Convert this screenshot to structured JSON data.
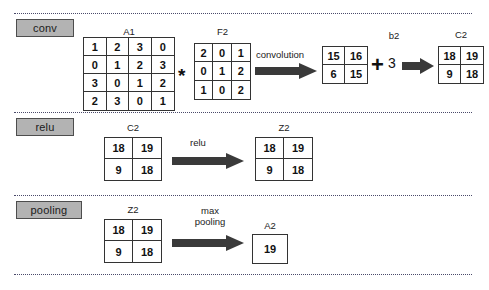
{
  "sections": [
    {
      "id": "conv",
      "tag": "conv",
      "matrices": [
        {
          "name": "A1",
          "rows": [
            [
              1,
              2,
              3,
              0
            ],
            [
              0,
              1,
              2,
              3
            ],
            [
              3,
              0,
              1,
              2
            ],
            [
              2,
              3,
              0,
              1
            ]
          ]
        },
        {
          "name": "F2",
          "rows": [
            [
              2,
              0,
              1
            ],
            [
              0,
              1,
              2
            ],
            [
              1,
              0,
              2
            ]
          ]
        },
        {
          "name": "",
          "rows": [
            [
              15,
              16
            ],
            [
              6,
              15
            ]
          ]
        },
        {
          "name": "C2",
          "rows": [
            [
              18,
              19
            ],
            [
              9,
              18
            ]
          ]
        }
      ],
      "operators": {
        "convolve_symbol": "*",
        "plus_symbol": "+",
        "bias_label": "b2",
        "bias_value": "3"
      },
      "arrow_labels": [
        "convolution"
      ]
    },
    {
      "id": "relu",
      "tag": "relu",
      "matrices": [
        {
          "name": "C2",
          "rows": [
            [
              18,
              19
            ],
            [
              9,
              18
            ]
          ]
        },
        {
          "name": "Z2",
          "rows": [
            [
              18,
              19
            ],
            [
              9,
              18
            ]
          ]
        }
      ],
      "arrow_labels": [
        "relu"
      ]
    },
    {
      "id": "pooling",
      "tag": "pooling",
      "matrices": [
        {
          "name": "Z2",
          "rows": [
            [
              18,
              19
            ],
            [
              9,
              18
            ]
          ]
        },
        {
          "name": "A2",
          "rows": [
            [
              19
            ]
          ]
        }
      ],
      "arrow_labels": [
        "max",
        "pooling"
      ]
    }
  ],
  "colors": {
    "tag_fill": "#b3b3b3",
    "tag_border": "#4d4d4d",
    "matrix_border": "#333333",
    "arrow_fill": "#3a3a3a",
    "divider": "#4a4a6a",
    "text": "#222222",
    "background": "#ffffff"
  }
}
